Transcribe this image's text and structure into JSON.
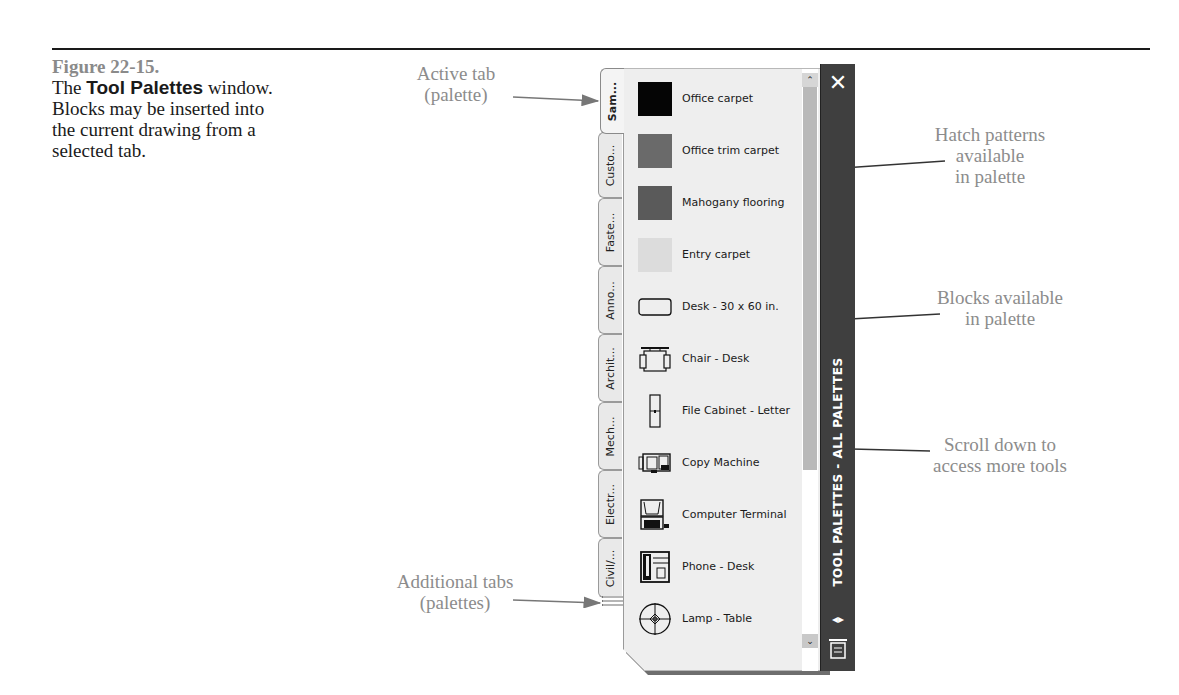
{
  "caption": {
    "figure_number": "Figure 22-15.",
    "text_prefix": "The ",
    "text_bold": "Tool Palettes",
    "text_suffix": " window. Blocks may be inserted into the current drawing from a selected tab."
  },
  "callouts": {
    "active_tab": [
      "Active tab",
      "(palette)"
    ],
    "hatch_patterns": [
      "Hatch patterns",
      "available",
      "in palette"
    ],
    "blocks": [
      "Blocks available",
      "in palette"
    ],
    "scroll": [
      "Scroll down to",
      "access more tools"
    ],
    "additional_tabs": [
      "Additional tabs",
      "(palettes)"
    ]
  },
  "palette": {
    "title": "TOOL PALETTES - ALL PALETTES",
    "close_icon": "✕",
    "autohide_icon": "◂▸",
    "properties_icon": "properties-menu-icon",
    "scroll_up": "⌃",
    "scroll_down": "⌄",
    "tabs": [
      {
        "label": "Sam...",
        "active": true
      },
      {
        "label": "Custo...",
        "active": false
      },
      {
        "label": "Faste...",
        "active": false
      },
      {
        "label": "Anno...",
        "active": false
      },
      {
        "label": "Archit...",
        "active": false
      },
      {
        "label": "Mech...",
        "active": false
      },
      {
        "label": "Electr...",
        "active": false
      },
      {
        "label": "Civil/...",
        "active": false
      }
    ],
    "hatch_items": [
      {
        "label": "Office carpet",
        "color": "#050505"
      },
      {
        "label": "Office trim carpet",
        "color": "#6a6a6a"
      },
      {
        "label": "Mahogany flooring",
        "color": "#5a5a5a"
      },
      {
        "label": "Entry carpet",
        "color": "#dcdcdc"
      }
    ],
    "block_items": [
      {
        "label": "Desk - 30 x 60 in.",
        "icon": "desk-icon"
      },
      {
        "label": "Chair - Desk",
        "icon": "chair-icon"
      },
      {
        "label": "File Cabinet - Letter",
        "icon": "file-cabinet-icon"
      },
      {
        "label": "Copy Machine",
        "icon": "copy-machine-icon"
      },
      {
        "label": "Computer Terminal",
        "icon": "computer-terminal-icon"
      },
      {
        "label": "Phone - Desk",
        "icon": "phone-icon"
      },
      {
        "label": "Lamp - Table",
        "icon": "lamp-icon"
      }
    ]
  }
}
